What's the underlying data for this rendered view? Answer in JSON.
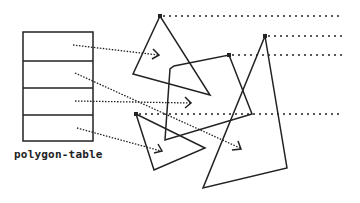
{
  "diagram": {
    "table_label": "polygon-table",
    "table_rows": 4,
    "polygons": [
      {
        "name": "triangle-top-left",
        "vertex_count": 3
      },
      {
        "name": "quadrilateral-middle",
        "vertex_count": 4
      },
      {
        "name": "triangle-bottom-left",
        "vertex_count": 3
      },
      {
        "name": "triangle-large-right",
        "vertex_count": 3
      }
    ],
    "pointers": [
      {
        "from_row": 1,
        "to": "triangle-top-left"
      },
      {
        "from_row": 2,
        "to": "triangle-large-right"
      },
      {
        "from_row": 3,
        "to": "quadrilateral-middle"
      },
      {
        "from_row": 4,
        "to": "triangle-bottom-left"
      }
    ],
    "colors": {
      "ink": "#222222",
      "background": "#ffffff"
    }
  }
}
